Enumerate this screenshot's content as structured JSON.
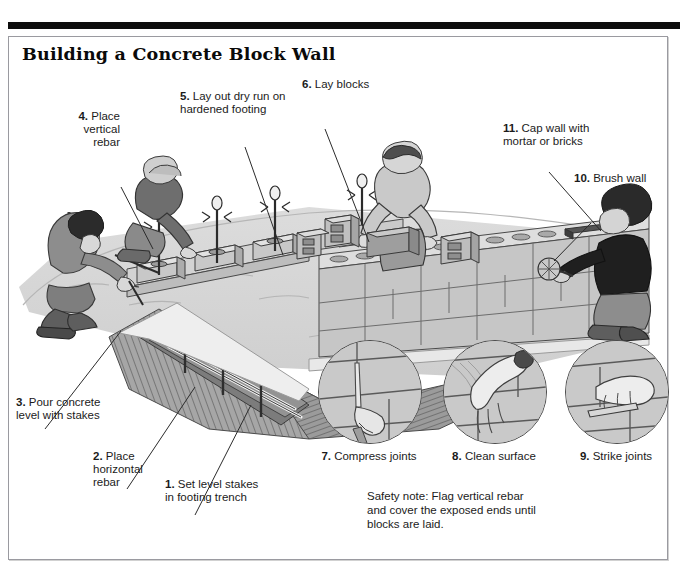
{
  "document": {
    "title": "Building a Concrete Block Wall"
  },
  "steps": [
    {
      "num": "1.",
      "text": "Set level stakes\nin footing trench"
    },
    {
      "num": "2.",
      "text": "Place\nhorizontal\nrebar"
    },
    {
      "num": "3.",
      "text": "Pour concrete\nlevel with stakes"
    },
    {
      "num": "4.",
      "text": "Place\nvertical\nrebar"
    },
    {
      "num": "5.",
      "text": "Lay out dry run on\nhardened footing"
    },
    {
      "num": "6.",
      "text": "Lay blocks"
    },
    {
      "num": "10.",
      "text": "Brush wall"
    },
    {
      "num": "11.",
      "text": "Cap wall with\nmortar or bricks"
    }
  ],
  "insets": [
    {
      "num": "7.",
      "label": "Compress joints"
    },
    {
      "num": "8.",
      "label": "Clean surface"
    },
    {
      "num": "9.",
      "label": "Strike joints"
    }
  ],
  "safety_note": "Safety note: Flag vertical rebar\nand cover the exposed ends until\nblocks are laid.",
  "colors": {
    "rule": "#0d0d0d",
    "frame_border": "#9a9aa0",
    "block_face": "#c4c4c4",
    "block_top": "#d8d8d8",
    "ground": "#d5d5d5",
    "soil": "#8f8f8f",
    "skin": "#d9d9d9",
    "shirt_dark": "#6f6f6f",
    "shirt_black": "#1f1f1f"
  }
}
